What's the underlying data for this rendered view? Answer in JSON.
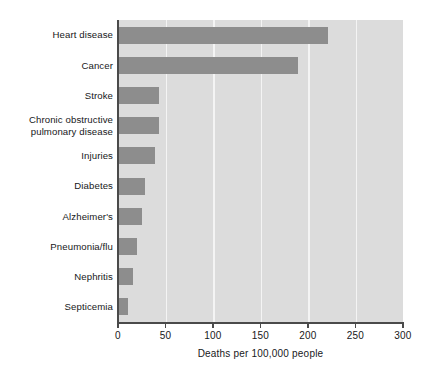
{
  "chart_data": {
    "type": "bar",
    "orientation": "horizontal",
    "title": "",
    "xlabel": "Deaths per 100,000 people",
    "ylabel": "",
    "xlim": [
      0,
      300
    ],
    "xticks": [
      "0",
      "50",
      "100",
      "150",
      "200",
      "250",
      "300"
    ],
    "grid": true,
    "legend": "none",
    "categories": [
      "Heart disease",
      "Cancer",
      "Stroke",
      "Chronic obstructive\npulmonary disease",
      "Injuries",
      "Diabetes",
      "Alzheimer's",
      "Pneumonia/flu",
      "Nephritis",
      "Septicemia"
    ],
    "values": [
      221,
      189,
      43,
      43,
      39,
      28,
      25,
      20,
      16,
      11
    ],
    "colors": {
      "bar": "#8d8d8d",
      "plot_background": "#dcdcdc",
      "gridline": "#f4f4f4",
      "axis": "#4a4a4a",
      "text": "#17181a",
      "page_background": "#ffffff"
    }
  }
}
